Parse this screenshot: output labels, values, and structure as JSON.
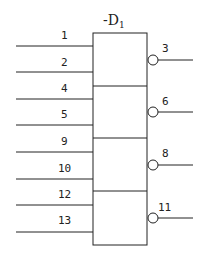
{
  "title": {
    "prefix": "-D",
    "subscript": "1"
  },
  "inputs": [
    {
      "label": "1"
    },
    {
      "label": "2"
    },
    {
      "label": "4"
    },
    {
      "label": "5"
    },
    {
      "label": "9"
    },
    {
      "label": "10"
    },
    {
      "label": "12"
    },
    {
      "label": "13"
    }
  ],
  "outputs": [
    {
      "label": "3"
    },
    {
      "label": "6"
    },
    {
      "label": "8"
    },
    {
      "label": "11"
    }
  ],
  "colors": {
    "stroke": "#222222",
    "background": "#ffffff"
  }
}
